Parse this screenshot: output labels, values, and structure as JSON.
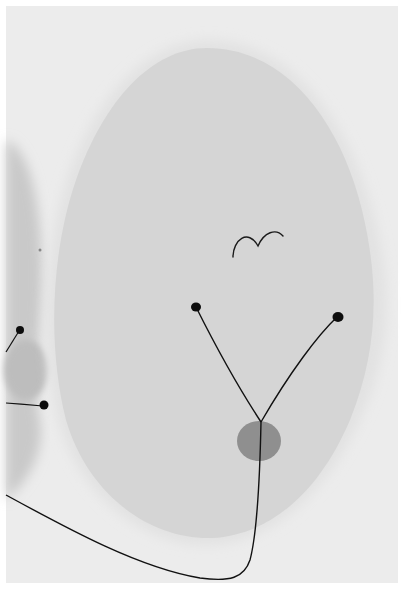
{
  "artwork": {
    "kind": "abstract painting (grayscale reproduction)",
    "colors": {
      "border": "#ffffff",
      "ground": "#eeeeee",
      "ground_left": "#cfcfcf",
      "oval": "#d6d6d6",
      "halo": "#e6e6e6",
      "disc": "#8e8e8e",
      "ink": "#111111"
    },
    "shapes": [
      "large-pale-oval",
      "bird-glyph",
      "y-shaped-stem-with-two-dots",
      "gray-disc",
      "left-edge-dots",
      "sweeping-base-line"
    ]
  }
}
